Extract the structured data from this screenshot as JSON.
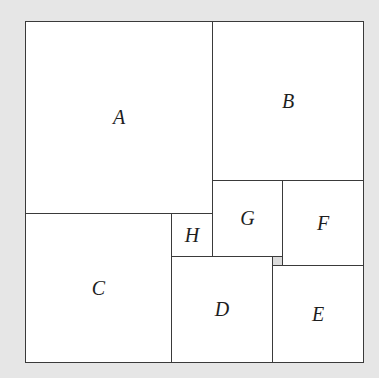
{
  "diagram": {
    "type": "squared-rectangle",
    "squares": [
      {
        "id": "A",
        "label": "A",
        "x": 25,
        "y": 21,
        "w": 188,
        "h": 193
      },
      {
        "id": "B",
        "label": "B",
        "x": 212,
        "y": 21,
        "w": 152,
        "h": 160
      },
      {
        "id": "G",
        "label": "G",
        "x": 212,
        "y": 180,
        "w": 71,
        "h": 77
      },
      {
        "id": "F",
        "label": "F",
        "x": 282,
        "y": 180,
        "w": 82,
        "h": 86
      },
      {
        "id": "H",
        "label": "H",
        "x": 171,
        "y": 213,
        "w": 42,
        "h": 44
      },
      {
        "id": "C",
        "label": "C",
        "x": 25,
        "y": 213,
        "w": 147,
        "h": 150
      },
      {
        "id": "D",
        "label": "D",
        "x": 171,
        "y": 256,
        "w": 102,
        "h": 107
      },
      {
        "id": "E",
        "label": "E",
        "x": 272,
        "y": 265,
        "w": 92,
        "h": 98
      },
      {
        "id": "tiny",
        "label": "",
        "x": 272,
        "y": 256,
        "w": 11,
        "h": 10
      }
    ]
  }
}
